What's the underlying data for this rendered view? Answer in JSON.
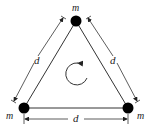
{
  "diagram": {
    "type": "equilateral-triangle-masses",
    "masses": [
      {
        "id": "top",
        "label": "m"
      },
      {
        "id": "bottom-left",
        "label": "m"
      },
      {
        "id": "bottom-right",
        "label": "m"
      }
    ],
    "sides": [
      {
        "id": "left",
        "label": "d"
      },
      {
        "id": "right",
        "label": "d"
      },
      {
        "id": "bottom",
        "label": "d"
      }
    ],
    "rotation": "clockwise",
    "colors": {
      "line": "#222222",
      "mass": "#000000",
      "background": "#ffffff"
    }
  }
}
